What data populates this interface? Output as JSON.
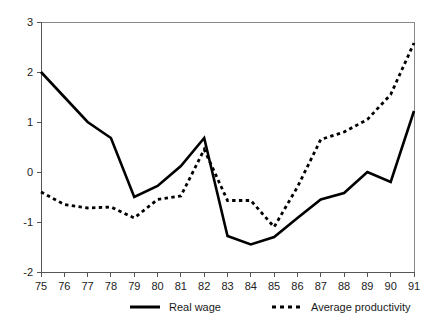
{
  "chart_data": {
    "type": "line",
    "title": "",
    "subtitle": "",
    "xlabel": "",
    "ylabel": "",
    "x": [
      75,
      76,
      77,
      78,
      79,
      80,
      81,
      82,
      83,
      84,
      85,
      86,
      87,
      88,
      89,
      90,
      91
    ],
    "categories": [
      "75",
      "76",
      "77",
      "78",
      "79",
      "80",
      "81",
      "82",
      "83",
      "84",
      "85",
      "86",
      "87",
      "88",
      "89",
      "90",
      "91"
    ],
    "xlim": [
      75,
      91
    ],
    "ylim": [
      -2,
      3
    ],
    "xticks": [
      "75",
      "76",
      "77",
      "78",
      "79",
      "80",
      "81",
      "82",
      "83",
      "84",
      "85",
      "86",
      "87",
      "88",
      "89",
      "90",
      "91"
    ],
    "yticks": [
      "3",
      "2",
      "1",
      "0",
      "-1",
      "-2"
    ],
    "ytick_values": [
      3,
      2,
      1,
      0,
      -1,
      -2
    ],
    "grid": false,
    "legend_position": "bottom",
    "series": [
      {
        "name": "Real wage",
        "style": "solid",
        "color": "#000000",
        "values": [
          2.0,
          1.5,
          1.0,
          0.68,
          -0.5,
          -0.28,
          0.12,
          0.68,
          -1.28,
          -1.45,
          -1.3,
          -0.92,
          -0.55,
          -0.42,
          0.0,
          -0.2,
          1.22
        ]
      },
      {
        "name": "Average productivity",
        "style": "dotted",
        "color": "#000000",
        "values": [
          -0.4,
          -0.65,
          -0.72,
          -0.7,
          -0.92,
          -0.55,
          -0.48,
          0.45,
          -0.57,
          -0.57,
          -1.1,
          -0.3,
          0.65,
          0.8,
          1.05,
          1.55,
          2.58
        ]
      }
    ]
  },
  "legend": {
    "items": [
      {
        "label": "Real wage",
        "style": "solid"
      },
      {
        "label": "Average productivity",
        "style": "dotted"
      }
    ]
  }
}
